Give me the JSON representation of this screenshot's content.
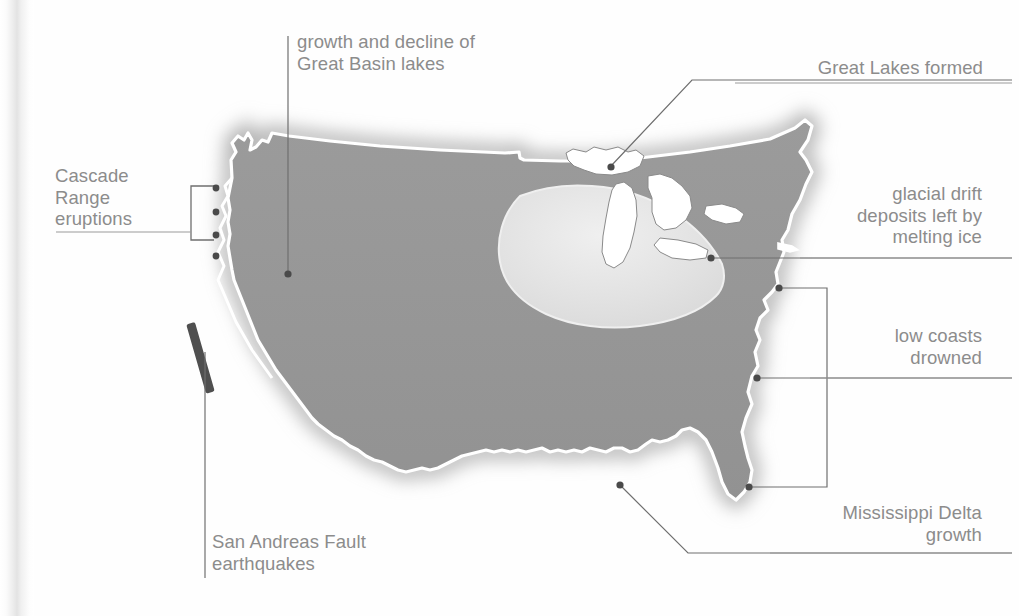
{
  "figure": {
    "kind": "map",
    "colors": {
      "land_fill": "#969696",
      "glacial_drift_fill": "#e4e4e4",
      "lake_fill": "#ffffff",
      "coast_halo": "#ffffff",
      "label_text": "#8c8c8c",
      "leader_line": "#9a9a9a",
      "marker_dot": "#4a4a4a",
      "fault_bar": "#4f4f4f",
      "background": "#ffffff",
      "gutter_shadow": "#e3e3e3"
    }
  },
  "annotations": [
    {
      "id": "cascade",
      "label": "Cascade\nRange\neruptions",
      "align": "left",
      "marker": "bracket-with-volcano-dots",
      "dot_count": 4
    },
    {
      "id": "great_basin_lakes",
      "label": "growth and decline of\nGreat Basin lakes",
      "align": "left",
      "marker": "dot"
    },
    {
      "id": "great_lakes",
      "label": "Great Lakes formed",
      "align": "right",
      "marker": "dot"
    },
    {
      "id": "glacial_drift",
      "label": "glacial drift\ndeposits left by\nmelting ice",
      "align": "right",
      "marker": "dot"
    },
    {
      "id": "low_coasts",
      "label": "low coasts\ndrowned",
      "align": "right",
      "marker": "bracket-two-dots"
    },
    {
      "id": "mississippi_delta",
      "label": "Mississippi Delta\ngrowth",
      "align": "right",
      "marker": "dot"
    },
    {
      "id": "san_andreas",
      "label": "San Andreas Fault\nearthquakes",
      "align": "left",
      "marker": "fault-bar"
    }
  ]
}
